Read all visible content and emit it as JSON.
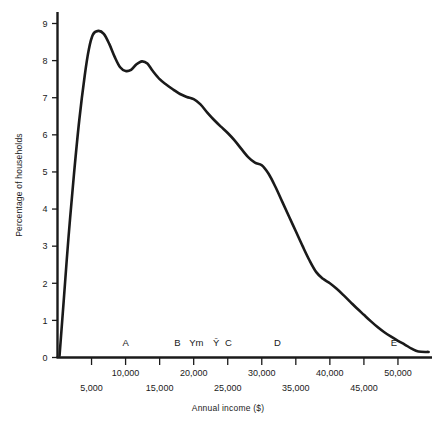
{
  "chart_data": {
    "type": "line",
    "title": "",
    "xlabel": "Annual income ($)",
    "ylabel": "Percentage of households",
    "xlim": [
      0,
      55000
    ],
    "ylim": [
      0,
      9.4
    ],
    "grid": false,
    "legend": "none",
    "y_ticks": [
      0,
      1,
      2,
      3,
      4,
      5,
      6,
      7,
      8,
      9
    ],
    "y_tick_labels": [
      "0",
      "1",
      "2",
      "3",
      "4",
      "5",
      "6",
      "7",
      "8",
      "9"
    ],
    "x_ticks": [
      5000,
      10000,
      15000,
      20000,
      25000,
      30000,
      35000,
      40000,
      45000,
      50000
    ],
    "x_tick_labels": [
      "5,000",
      "10,000",
      "15,000",
      "20,000",
      "25,000",
      "30,000",
      "35,000",
      "40,000",
      "45,000",
      "50,000"
    ],
    "x_tick_label_rows": [
      1,
      0,
      1,
      0,
      1,
      0,
      1,
      0,
      1,
      0
    ],
    "series": [
      {
        "name": "Percentage of households",
        "x": [
          300,
          900,
          1600,
          2400,
          3200,
          4000,
          4600,
          5200,
          6000,
          6800,
          7600,
          8400,
          9200,
          10000,
          10800,
          11600,
          12400,
          13200,
          14000,
          15000,
          16000,
          17000,
          18000,
          19000,
          20000,
          21000,
          22000,
          23000,
          24000,
          25000,
          26000,
          27000,
          28000,
          29000,
          30000,
          31000,
          32000,
          33000,
          34000,
          35000,
          36000,
          37000,
          38000,
          39000,
          40000,
          41000,
          42000,
          43000,
          44000,
          45000,
          46000,
          47000,
          48000,
          49000,
          50000,
          51000,
          52000,
          53000,
          54500
        ],
        "y": [
          0.05,
          1.5,
          3.2,
          4.9,
          6.4,
          7.6,
          8.3,
          8.7,
          8.8,
          8.72,
          8.45,
          8.1,
          7.82,
          7.72,
          7.75,
          7.9,
          7.98,
          7.92,
          7.72,
          7.5,
          7.35,
          7.22,
          7.1,
          7.02,
          6.96,
          6.82,
          6.6,
          6.4,
          6.22,
          6.05,
          5.85,
          5.62,
          5.4,
          5.25,
          5.18,
          4.95,
          4.6,
          4.2,
          3.8,
          3.4,
          3.0,
          2.62,
          2.3,
          2.12,
          2.0,
          1.85,
          1.68,
          1.5,
          1.32,
          1.15,
          0.98,
          0.82,
          0.68,
          0.56,
          0.45,
          0.35,
          0.24,
          0.16,
          0.15
        ]
      }
    ],
    "annotations": [
      {
        "label": "A",
        "x": 10000,
        "y": 0.32
      },
      {
        "label": "B",
        "x": 17600,
        "y": 0.32
      },
      {
        "label": "Ym",
        "x": 20400,
        "y": 0.32
      },
      {
        "label": "Ȳ",
        "x": 23300,
        "y": 0.32
      },
      {
        "label": "C",
        "x": 25100,
        "y": 0.32
      },
      {
        "label": "D",
        "x": 32300,
        "y": 0.32
      },
      {
        "label": "E",
        "x": 49400,
        "y": 0.32
      }
    ]
  }
}
